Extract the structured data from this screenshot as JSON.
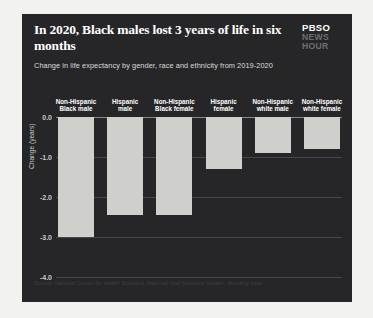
{
  "header": {
    "title": "In 2020, Black males lost 3 years of life in six months",
    "subtitle": "Change in life expectancy by gender, race and ethnicity from 2019-2020"
  },
  "logo": {
    "line1": "PBSO",
    "line2": "NEWS",
    "line3": "HOUR"
  },
  "source": "Source: National Center for Health Statistics, National Vital Statistics System, Mortality data",
  "colors": {
    "card_background": "#262628",
    "bar_fill": "#cfcfcb",
    "gridline": "#48484c",
    "zero_line": "#8a8a8e",
    "title_text": "#ffffff",
    "tick_text": "#c9c9c9"
  },
  "chart_data": {
    "type": "bar",
    "title": "In 2020, Black males lost 3 years of life in six months",
    "subtitle": "Change in life expectancy by gender, race and ethnicity from 2019-2020",
    "xlabel": "",
    "ylabel": "Change (years)",
    "ylim": [
      -4.0,
      0.0
    ],
    "yticks": [
      "0.0",
      "-1.0",
      "-2.0",
      "-3.0",
      "-4.0"
    ],
    "ytick_values": [
      0.0,
      -1.0,
      -2.0,
      -3.0,
      -4.0
    ],
    "grid": true,
    "legend": false,
    "categories": [
      "Non-Hispanic Black male",
      "Hispanic male",
      "Non-Hispanic Black female",
      "Hispanic female",
      "Non-Hispanic white male",
      "Non-Hispanic white female"
    ],
    "category_lines": [
      [
        "Non-Hispanic",
        "Black male"
      ],
      [
        "Hispanic",
        "male"
      ],
      [
        "Non-Hispanic",
        "Black female"
      ],
      [
        "Hispanic",
        "female"
      ],
      [
        "Non-Hispanic",
        "white male"
      ],
      [
        "Non-Hispanic",
        "white female"
      ]
    ],
    "values": [
      -3.0,
      -2.45,
      -2.45,
      -1.3,
      -0.9,
      -0.8
    ]
  }
}
